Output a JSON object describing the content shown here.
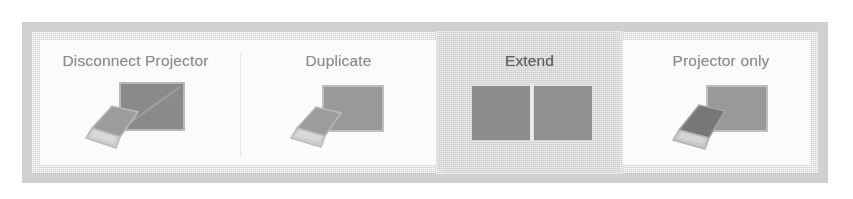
{
  "dialog": {
    "name": "projection-mode-selector",
    "accent_selected_bg": "#d8d8d8",
    "frame_color": "#d3d3d3",
    "label_color": "#8c8c8c",
    "selected_label_color": "#5e5e5e",
    "screen_fill": "#8f8f8f",
    "screen_fill_dark": "#6f6f6f",
    "laptop_fill": "#9a9a9a"
  },
  "options": [
    {
      "id": "disconnect-projector",
      "label": "Disconnect Projector",
      "icon": "laptop-with-disconnected-monitor-icon",
      "selected": false
    },
    {
      "id": "duplicate",
      "label": "Duplicate",
      "icon": "laptop-with-duplicated-monitor-icon",
      "selected": false
    },
    {
      "id": "extend",
      "label": "Extend",
      "icon": "two-extended-screens-icon",
      "selected": true
    },
    {
      "id": "projector-only",
      "label": "Projector only",
      "icon": "laptop-off-with-monitor-on-icon",
      "selected": false
    }
  ]
}
